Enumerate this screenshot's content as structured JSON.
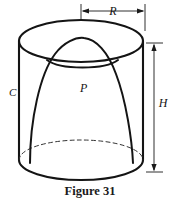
{
  "figure": {
    "caption": "Figure 31",
    "labels": {
      "cylinder": "C",
      "paraboloid": "P",
      "radius": "R",
      "height": "H"
    },
    "colors": {
      "ink": "#141414",
      "background": "#ffffff",
      "hidden_edge": "#333333"
    }
  }
}
